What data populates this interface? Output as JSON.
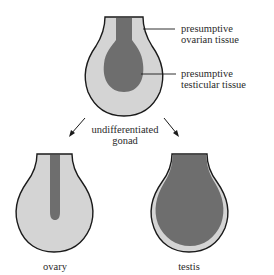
{
  "diagram": {
    "title": "",
    "colors": {
      "ovarian_tissue": "#d4d4d4",
      "testicular_tissue": "#6e6e6e",
      "outline": "#1a1a1a",
      "text": "#2a2a2a"
    },
    "top_gonad": {
      "label_ovarian_line1": "presumptive",
      "label_ovarian_line2": "ovarian tissue",
      "label_testicular_line1": "presumptive",
      "label_testicular_line2": "testicular tissue",
      "caption_line1": "undifferentiated",
      "caption_line2": "gonad"
    },
    "left_gonad": {
      "label": "ovary"
    },
    "right_gonad": {
      "label": "testis"
    }
  }
}
